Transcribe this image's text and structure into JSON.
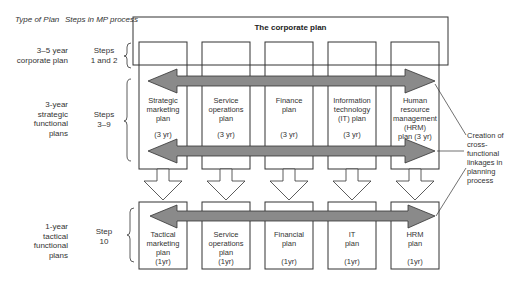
{
  "headers": {
    "type_of_plan": "Type of Plan",
    "steps_in_mp": "Steps in MP process"
  },
  "corporate_plan": {
    "title": "The corporate plan"
  },
  "rows": [
    {
      "type": "3–5 year\ncorporate plan",
      "steps": "Steps\n1 and 2"
    },
    {
      "type": "3-year\nstrategic\nfunctional\nplans",
      "steps": "Steps\n3–9"
    },
    {
      "type": "1-year\ntactical\nfunctional\nplans",
      "steps": "Step\n10"
    }
  ],
  "strategic_plans": [
    {
      "name": "Strategic\nmarketing\nplan",
      "period": "(3 yr)"
    },
    {
      "name": "Service\noperations\nplan",
      "period": "(3 yr)"
    },
    {
      "name": "Finance\nplan",
      "period": "(3 yr)"
    },
    {
      "name": "Information\ntechnology\n(IT) plan",
      "period": "(3 yr)"
    },
    {
      "name": "Human\nresource\nmanagement\n(HRM)\nplan (3 yr)",
      "period": ""
    }
  ],
  "tactical_plans": [
    {
      "name": "Tactical\nmarketing\nplan",
      "period": "(1yr)"
    },
    {
      "name": "Service\noperations\nplan",
      "period": "(1yr)"
    },
    {
      "name": "Financial\nplan",
      "period": "(1yr)"
    },
    {
      "name": "IT\nplan",
      "period": "(1yr)"
    },
    {
      "name": "HRM\nplan",
      "period": "(1yr)"
    }
  ],
  "annotation": {
    "text": "Creation of\ncross-\nfunctional\nlinkages in\nplanning\nprocess"
  },
  "colors": {
    "arrow_fill": "#8a8a8a",
    "line": "#333333"
  }
}
